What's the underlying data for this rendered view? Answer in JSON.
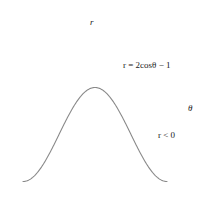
{
  "figure": {
    "title": "",
    "equation_label": "r = 2cosθ − 1",
    "region_label": "r < 0",
    "axis_x_name": "θ",
    "axis_y_name": "r"
  },
  "chart_data": {
    "type": "line",
    "title": "",
    "subtitle": "",
    "xlabel": "θ",
    "ylabel": "r",
    "equation": "r = 2cosθ − 1",
    "annotations": [
      "r = 2cosθ − 1",
      "r < 0"
    ],
    "grid": false,
    "legend": "none",
    "xlim": [
      -3.4906585,
      3.6651914
    ],
    "ylim": [
      -3.45,
      1.55
    ],
    "x_tick_labels": [
      "−π",
      "−2π/3",
      "−π/3",
      "π/3",
      "2π/3",
      "π"
    ],
    "x_tick_values": [
      -3.14159265,
      -2.0943951,
      -1.04719755,
      1.04719755,
      2.0943951,
      3.14159265
    ],
    "y_tick_labels": [
      "1",
      "−1",
      "−2",
      "−3"
    ],
    "y_tick_values": [
      1,
      -1,
      -2,
      -3
    ],
    "x": [
      -3.14159265,
      -2.87979327,
      -2.61799388,
      -2.35619449,
      -2.0943951,
      -1.83259571,
      -1.57079633,
      -1.30899694,
      -1.04719755,
      -0.78539816,
      -0.52359878,
      -0.26179939,
      0,
      0.26179939,
      0.52359878,
      0.78539816,
      1.04719755,
      1.30899694,
      1.57079633,
      1.83259571,
      2.0943951,
      2.35619449,
      2.61799388,
      2.87979327,
      3.14159265
    ],
    "y": [
      -3,
      -2.93185,
      -2.73205,
      -2.41421,
      -2,
      -1.51764,
      -1,
      -0.48236,
      0,
      0.41421,
      0.73205,
      0.93185,
      1,
      0.93185,
      0.73205,
      0.41421,
      0,
      -0.48236,
      -1,
      -1.51764,
      -2,
      -2.41421,
      -2.73205,
      -2.93185,
      -3
    ],
    "points": [
      {
        "label": "A",
        "theta": 0,
        "theta_label": "0",
        "r": 1,
        "label_dx": 5,
        "label_dy": -8
      },
      {
        "label": "B",
        "theta": 0.52359878,
        "theta_label": "π/6",
        "r": 0.73205,
        "label_dx": 4,
        "label_dy": -8
      },
      {
        "label": "C",
        "theta": 1.04719755,
        "theta_label": "π/3",
        "r": 0,
        "label_dx": 3,
        "label_dy": -8
      },
      {
        "label": "D",
        "theta": 1.57079633,
        "theta_label": "π/2",
        "r": -1,
        "label_dx": -9,
        "label_dy": 10
      },
      {
        "label": "E",
        "theta": 2.0943951,
        "theta_label": "2π/3",
        "r": -2,
        "label_dx": 2,
        "label_dy": -7
      },
      {
        "label": "F",
        "theta": 2.61799388,
        "theta_label": "5π/6",
        "r": -2.73205,
        "label_dx": 1,
        "label_dy": -7
      },
      {
        "label": "G",
        "theta": 3.14159265,
        "theta_label": "π",
        "r": -3,
        "label_dx": 5,
        "label_dy": -6
      }
    ]
  },
  "colors": {
    "axis": "#1a1a1a",
    "curve": "#8a8a8a",
    "point": "#000000",
    "text": "#1a1a1a",
    "background": "#ffffff"
  }
}
